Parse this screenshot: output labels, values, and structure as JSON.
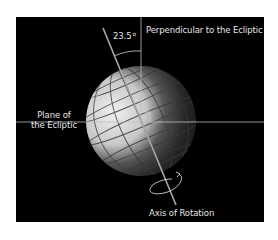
{
  "diagram": {
    "labels": {
      "perpendicular": "Perpendicular to the Ecliptic",
      "angle_value": "23.5",
      "angle_unit": "o",
      "plane_line1": "Plane of",
      "plane_line2": "the Ecliptic",
      "axis": "Axis of Rotation"
    },
    "colors": {
      "background": "#000000",
      "page": "#ffffff",
      "lines": "#cfcfcf",
      "text": "#e6e6e6",
      "globe_light": "#e8e8e8",
      "globe_dark": "#1a1a1a"
    },
    "geometry": {
      "globe_center": [
        141,
        121
      ],
      "globe_radius": 55,
      "tilt_degrees": 23.5,
      "axis_start": [
        103,
        28
      ],
      "axis_end": [
        176,
        205
      ],
      "ecliptic_y": 122,
      "perpendicular_x": 141
    }
  }
}
